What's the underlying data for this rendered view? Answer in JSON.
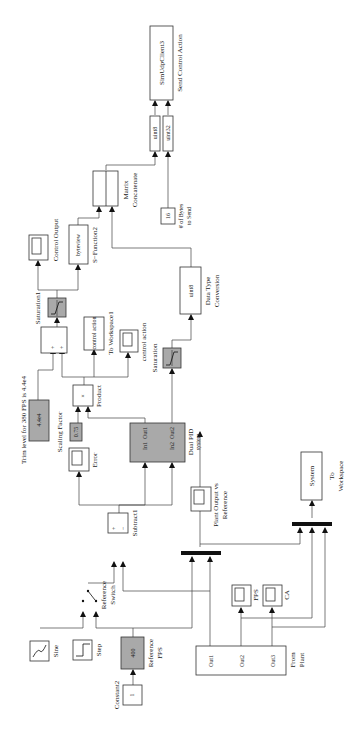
{
  "diagram": {
    "orientation": "rotated-90-ccw",
    "blocks": {
      "sine": {
        "label": "Sine"
      },
      "step": {
        "label": "Step"
      },
      "constant2": {
        "label": "Constant2",
        "value": "1"
      },
      "reference_fps": {
        "label": "Reference FPS",
        "label_l1": "Reference",
        "label_l2": "FPS",
        "value": "400"
      },
      "reference_switch": {
        "label_l1": "Reference",
        "label_l2": "Switch"
      },
      "subtract1": {
        "label": "Subtract1",
        "plus": "+",
        "minus": "−"
      },
      "error_scope": {
        "label": "Error"
      },
      "scaling_factor": {
        "label": "Scaling Factor",
        "value": "0.75"
      },
      "trim_level": {
        "label": "Trim level for 380 FPS is 4.4e4",
        "value": "4.4e4"
      },
      "product": {
        "label": "Product",
        "symbol": "×"
      },
      "dual_pid": {
        "label_l1": "Dual PID",
        "label_l2": "system",
        "in1": "In1",
        "in2": "In2",
        "out1": "Out1",
        "out2": "Out2"
      },
      "sum": {
        "plus1": "+",
        "plus2": "+"
      },
      "saturation1": {
        "label": "Saturation1"
      },
      "saturation": {
        "label": "Saturation"
      },
      "to_workspace1": {
        "value": "control action",
        "label": "To Workspace1"
      },
      "control_action_scope": {
        "label": "control action"
      },
      "control_output_scope": {
        "label": "Control Output"
      },
      "byteview": {
        "value": "byteview",
        "label": "S−Function2"
      },
      "data_type_conversion": {
        "value": "uint8",
        "label_l1": "Data Type",
        "label_l2": "Conversion"
      },
      "matrix_concatenate": {
        "label_l1": "Matrix",
        "label_l2": "Concatenate"
      },
      "bytes_to_send": {
        "value": "16",
        "label_l1": "# of Bytes",
        "label_l2": "to Send"
      },
      "uint8_cast": {
        "value": "uint8"
      },
      "uint32_cast": {
        "value": "uint32"
      },
      "udp_client": {
        "value": "SimUdpClient3",
        "label": "Send Control Action"
      },
      "plant_scope": {
        "label_l1": "Plant Output vs",
        "label_l2": "Reference"
      },
      "fps_scope": {
        "label": "FPS"
      },
      "ca_scope": {
        "label": "CA"
      },
      "from_plant": {
        "out1": "Out1",
        "out2": "Out2",
        "out3": "Out3",
        "label_l1": "From",
        "label_l2": "Plant"
      },
      "to_workspace": {
        "value": "System",
        "label_l1": "To",
        "label_l2": "Workspace"
      }
    }
  }
}
